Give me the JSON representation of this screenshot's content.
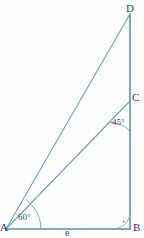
{
  "figure": {
    "background_color": "#fefeff",
    "line_color": "#5b8db5",
    "line_color_light": "#7ba3c4",
    "label_color": "#1d3a5c",
    "angle_color": "#2d4a6b"
  },
  "vertices": {
    "A": {
      "label": "A",
      "x": 6,
      "y": 229
    },
    "B": {
      "label": "B",
      "x": 130,
      "y": 229
    },
    "C": {
      "label": "C",
      "x": 130,
      "y": 101
    },
    "D": {
      "label": "D",
      "x": 130,
      "y": 14
    }
  },
  "segments": [
    {
      "name": "AB",
      "from": "A",
      "to": "B"
    },
    {
      "name": "DB",
      "from": "D",
      "to": "B"
    },
    {
      "name": "AC",
      "from": "A",
      "to": "C"
    },
    {
      "name": "AD",
      "from": "A",
      "to": "D"
    }
  ],
  "angles": {
    "at_A": {
      "label": "60°",
      "value": 60,
      "unit": "degrees"
    },
    "at_C": {
      "label": "45°",
      "value": 45,
      "unit": "degrees"
    },
    "at_B": {
      "label": "",
      "value": 90,
      "unit": "degrees",
      "marker": "right-angle"
    }
  },
  "sides": {
    "AB": {
      "label": "e"
    }
  }
}
